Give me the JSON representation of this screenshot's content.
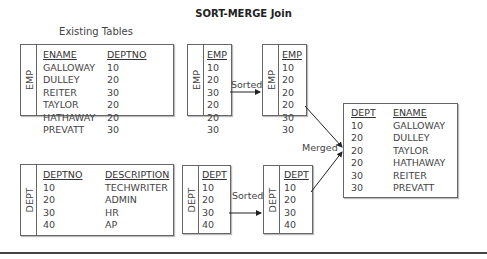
{
  "title": "SORT-MERGE Join",
  "subtitle": "Existing Tables",
  "existing_emp": {
    "side_label": "EMP",
    "headers": [
      "ENAME",
      "DEPTNO"
    ],
    "rows": [
      [
        "GALLOWAY",
        "10"
      ],
      [
        "DULLEY",
        "20"
      ],
      [
        "REITER",
        "30"
      ],
      [
        "TAYLOR",
        "20"
      ],
      [
        "HATHAWAY",
        "20"
      ],
      [
        "PREVATT",
        "30"
      ]
    ]
  },
  "existing_dept": {
    "side_label": "DEPT",
    "headers": [
      "DEPTNO",
      "DESCRIPTION"
    ],
    "rows": [
      [
        "10",
        "TECHWRITER"
      ],
      [
        "20",
        "ADMIN"
      ],
      [
        "30",
        "HR"
      ],
      [
        "40",
        "AP"
      ]
    ]
  },
  "emp_unsorted": {
    "side_label": "EMP",
    "header": "EMP",
    "values": [
      "10",
      "20",
      "30",
      "20",
      "20",
      "30"
    ]
  },
  "emp_sorted": {
    "side_label": "EMP",
    "header": "EMP",
    "values": [
      "10",
      "20",
      "20",
      "20",
      "30",
      "30"
    ]
  },
  "dept_unsorted": {
    "side_label": "DEPT",
    "header": "DEPT",
    "values": [
      "10",
      "20",
      "30",
      "40"
    ]
  },
  "dept_sorted": {
    "side_label": "DEPT",
    "header": "DEPT",
    "values": [
      "10",
      "20",
      "30",
      "40"
    ]
  },
  "arrows": {
    "sorted_emp": "Sorted",
    "sorted_dept": "Sorted",
    "merged": "Merged"
  },
  "result": {
    "headers": [
      "DEPT",
      "ENAME"
    ],
    "rows": [
      [
        "10",
        "GALLOWAY"
      ],
      [
        "20",
        "DULLEY"
      ],
      [
        "20",
        "TAYLOR"
      ],
      [
        "20",
        "HATHAWAY"
      ],
      [
        "30",
        "REITER"
      ],
      [
        "30",
        "PREVATT"
      ]
    ]
  }
}
